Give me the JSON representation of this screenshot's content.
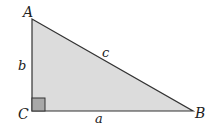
{
  "diagram": {
    "type": "right-triangle",
    "vertices": {
      "A": "A",
      "B": "B",
      "C": "C"
    },
    "sides": {
      "a": "a",
      "b": "b",
      "c": "c"
    },
    "fill_color": "#dcdcdc",
    "right_angle_color": "#a8a8a8",
    "stroke_color": "#333333"
  }
}
